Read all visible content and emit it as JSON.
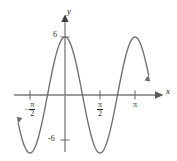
{
  "figure": {
    "kind": "cartesian-graph",
    "width": 177,
    "height": 161,
    "background": "#ffffff",
    "curve_color": "#6b6b6b",
    "axis_color": "#7a7a7a",
    "text_color": "#2b2b2b"
  },
  "axes": {
    "x_label": "x",
    "y_label": "y",
    "origin_px": {
      "x": 65,
      "y": 95
    },
    "x_unit_px_per_half_pi": 35,
    "y_unit_px_per_6": 58,
    "x_ticks": [
      {
        "id": "neg-half-pi",
        "value": -1.5708,
        "px": 30,
        "display": "-π/2",
        "numerator": "π",
        "denominator": "2",
        "negative": true
      },
      {
        "id": "half-pi",
        "value": 1.5708,
        "px": 100,
        "display": "π/2",
        "numerator": "π",
        "denominator": "2",
        "negative": false
      },
      {
        "id": "pi",
        "value": 3.1416,
        "px": 135,
        "display": "π",
        "numerator": "π",
        "denominator": "",
        "negative": false
      }
    ],
    "y_ticks": [
      {
        "id": "pos-six",
        "value": 6,
        "px": 37,
        "display": "6"
      },
      {
        "id": "neg-six",
        "value": -6,
        "px": 140,
        "display": "-6"
      }
    ]
  },
  "chart_data": {
    "type": "line",
    "title": "",
    "xlabel": "x",
    "ylabel": "y",
    "grid": false,
    "legend": null,
    "function": "y = 6 cos(2x)",
    "amplitude": 6,
    "period": "π",
    "midline": 0,
    "phase_shift": 0,
    "xlim": [
      -2.1,
      3.75
    ],
    "ylim": [
      -7.6,
      6.9
    ],
    "xticks": [
      -1.5708,
      1.5708,
      3.1416
    ],
    "xticklabels": [
      "-π/2",
      "π/2",
      "π"
    ],
    "yticks": [
      6,
      -6
    ],
    "yticklabels": [
      "6",
      "-6"
    ],
    "key_points": [
      {
        "x": -1.5708,
        "y": -6,
        "kind": "minimum"
      },
      {
        "x": -0.7854,
        "y": 0,
        "kind": "zero"
      },
      {
        "x": 0,
        "y": 6,
        "kind": "maximum"
      },
      {
        "x": 0.7854,
        "y": 0,
        "kind": "zero"
      },
      {
        "x": 1.5708,
        "y": -6,
        "kind": "minimum"
      },
      {
        "x": 2.3562,
        "y": 0,
        "kind": "zero"
      },
      {
        "x": 3.1416,
        "y": 6,
        "kind": "maximum"
      }
    ],
    "x": [
      -2.1,
      -2.0,
      -1.9,
      -1.8,
      -1.7,
      -1.6,
      -1.5,
      -1.4,
      -1.3,
      -1.2,
      -1.1,
      -1.0,
      -0.9,
      -0.8,
      -0.7,
      -0.6,
      -0.5,
      -0.4,
      -0.3,
      -0.2,
      -0.1,
      0.0,
      0.1,
      0.2,
      0.3,
      0.4,
      0.5,
      0.6,
      0.7,
      0.8,
      0.9,
      1.0,
      1.1,
      1.2,
      1.3,
      1.4,
      1.5,
      1.6,
      1.7,
      1.8,
      1.9,
      2.0,
      2.1,
      2.2,
      2.3,
      2.4,
      2.5,
      2.6,
      2.7,
      2.8,
      2.9,
      3.0,
      3.1,
      3.2,
      3.3,
      3.4,
      3.5,
      3.6,
      3.75
    ],
    "values": [
      -3.03,
      -4.39,
      -5.35,
      -5.88,
      -5.98,
      -5.65,
      -4.94,
      -3.89,
      -2.59,
      -1.14,
      0.35,
      1.81,
      3.15,
      4.28,
      5.16,
      5.71,
      5.92,
      5.76,
      5.25,
      4.41,
      3.29,
      6.0,
      5.88,
      5.53,
      4.95,
      4.18,
      3.24,
      2.17,
      1.01,
      -0.17,
      -1.34,
      -2.45,
      -3.44,
      -4.29,
      -4.97,
      -5.45,
      -5.72,
      -5.77,
      -5.6,
      -5.21,
      -4.63,
      -3.87,
      -2.96,
      -1.94,
      -0.85,
      0.27,
      1.38,
      2.44,
      3.41,
      4.26,
      4.94,
      5.44,
      5.73,
      5.79,
      5.63,
      5.25,
      4.67,
      3.92,
      2.52
    ],
    "annotations": [
      {
        "text": "x",
        "role": "x-axis-label"
      },
      {
        "text": "y",
        "role": "y-axis-label"
      }
    ]
  }
}
